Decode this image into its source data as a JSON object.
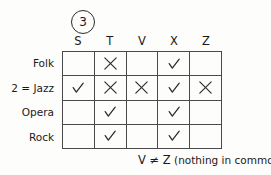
{
  "problem": {
    "number": "3"
  },
  "table": {
    "column_headers": [
      "S",
      "T",
      "V",
      "X",
      "Z"
    ],
    "row_labels": [
      "Folk",
      "2 = Jazz",
      "Opera",
      "Rock"
    ],
    "marks": [
      [
        "",
        "x",
        "",
        "check",
        ""
      ],
      [
        "check",
        "x",
        "x",
        "check",
        "x"
      ],
      [
        "",
        "check",
        "",
        "check",
        ""
      ],
      [
        "",
        "check",
        "",
        "check",
        ""
      ]
    ],
    "mark_glyphs": {
      "check": "check-mark",
      "x": "x-mark"
    }
  },
  "footer": {
    "expression": "V ≠ Z",
    "note": " (nothing in common)"
  },
  "colors": {
    "ink": "#1a1a1a",
    "rule": "#4a4a4a",
    "paper": "#fdfdfc"
  }
}
